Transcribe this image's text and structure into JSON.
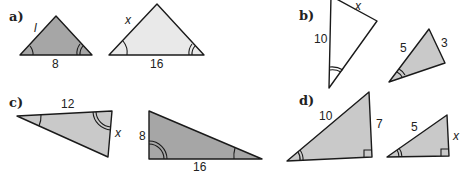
{
  "colors": {
    "dark_fill": "#a6a6a6",
    "mid_fill": "#c9c9c9",
    "light_fill": "#e9e9e9",
    "white_fill": "#ffffff",
    "stroke": "#1a1a1a"
  },
  "parts": [
    {
      "label": "a)",
      "triangles": [
        {
          "side_labels": [
            "l",
            "8"
          ],
          "fill": "dark"
        },
        {
          "side_labels": [
            "x",
            "16"
          ],
          "fill": "light"
        }
      ]
    },
    {
      "label": "b)",
      "triangles": [
        {
          "side_labels": [
            "10",
            "x"
          ],
          "fill": "white"
        },
        {
          "side_labels": [
            "5",
            "3"
          ],
          "fill": "mid"
        }
      ]
    },
    {
      "label": "c)",
      "triangles": [
        {
          "side_labels": [
            "12",
            "x"
          ],
          "fill": "mid"
        },
        {
          "side_labels": [
            "8",
            "16"
          ],
          "fill": "dark"
        }
      ]
    },
    {
      "label": "d)",
      "triangles": [
        {
          "side_labels": [
            "10",
            "7"
          ],
          "fill": "mid"
        },
        {
          "side_labels": [
            "5",
            "x"
          ],
          "fill": "mid"
        }
      ]
    }
  ]
}
